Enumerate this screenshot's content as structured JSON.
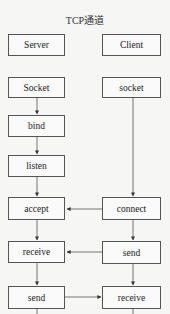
{
  "title": "TCP通道",
  "columns": {
    "server": {
      "header": "Server",
      "steps": [
        "Socket",
        "bind",
        "listen",
        "accept",
        "receive",
        "send"
      ]
    },
    "client": {
      "header": "Client",
      "steps": [
        "socket",
        "connect",
        "send",
        "receive"
      ]
    }
  },
  "cross_arrows": [
    {
      "from": "client.connect",
      "to": "server.accept",
      "direction": "left"
    },
    {
      "from": "client.send",
      "to": "server.receive",
      "direction": "left"
    },
    {
      "from": "server.send",
      "to": "client.receive",
      "direction": "right"
    }
  ],
  "colors": {
    "line": "#555555",
    "box_border": "#555555",
    "background": "#f6f6f4"
  }
}
